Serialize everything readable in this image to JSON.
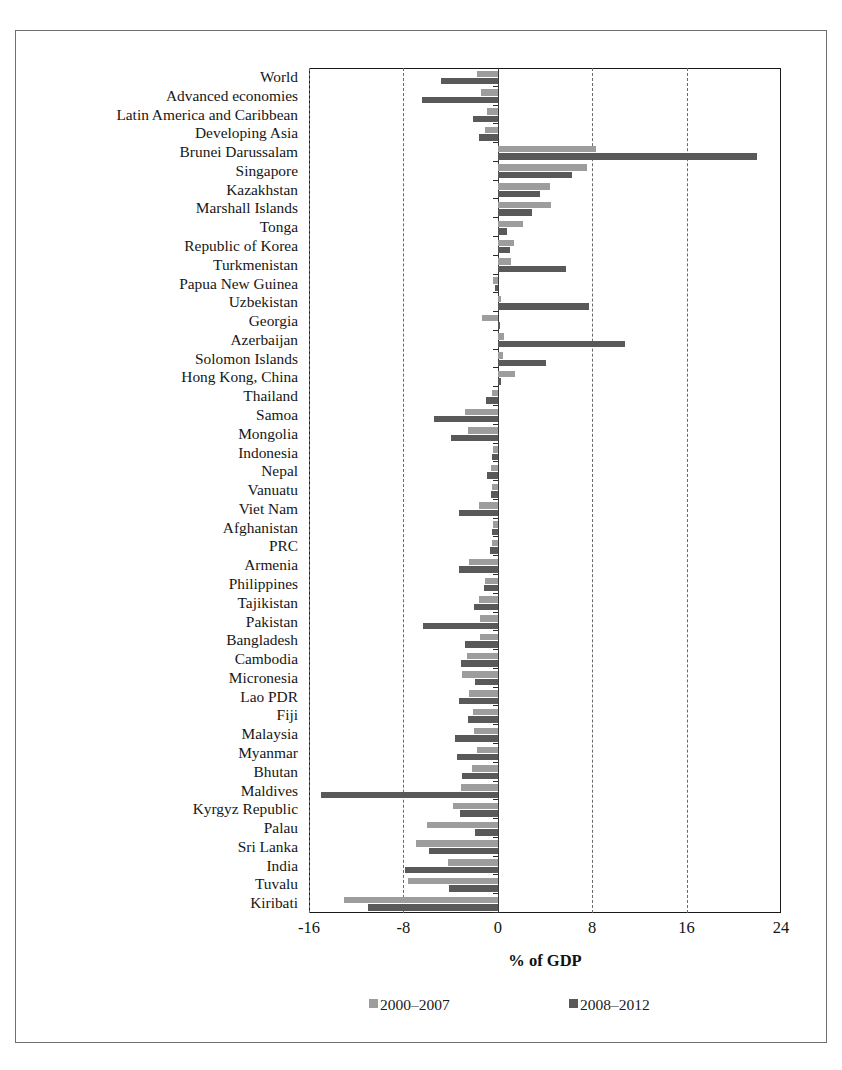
{
  "chart_data": {
    "type": "bar",
    "orientation": "horizontal",
    "title": "",
    "xlabel": "% of GDP",
    "ylabel": "",
    "xlim": [
      -16,
      24
    ],
    "xticks": [
      -16,
      -8,
      0,
      8,
      16,
      24
    ],
    "gridlines": [
      -16,
      -8,
      8,
      16
    ],
    "grid": true,
    "legend_position": "bottom",
    "colors": {
      "2000-2007": "#9d9d9d",
      "2008-2012": "#595959"
    },
    "categories": [
      "World",
      "Advanced economies",
      "Latin America and Caribbean",
      "Developing Asia",
      "Brunei Darussalam",
      "Singapore",
      "Kazakhstan",
      "Marshall Islands",
      "Tonga",
      "Republic of Korea",
      "Turkmenistan",
      "Papua New Guinea",
      "Uzbekistan",
      "Georgia",
      "Azerbaijan",
      "Solomon Islands",
      "Hong Kong, China",
      "Thailand",
      "Samoa",
      "Mongolia",
      "Indonesia",
      "Nepal",
      "Vanuatu",
      "Viet Nam",
      "Afghanistan",
      "PRC",
      "Armenia",
      "Philippines",
      "Tajikistan",
      "Pakistan",
      "Bangladesh",
      "Cambodia",
      "Micronesia",
      "Lao PDR",
      "Fiji",
      "Malaysia",
      "Myanmar",
      "Bhutan",
      "Maldives",
      "Kyrgyz Republic",
      "Palau",
      "Sri Lanka",
      "India",
      "Tuvalu",
      "Kiribati"
    ],
    "series": [
      {
        "name": "2000–2007",
        "color": "#9d9d9d",
        "values": [
          -1.8,
          -1.4,
          -0.9,
          -1.1,
          8.3,
          7.6,
          4.4,
          4.5,
          2.1,
          1.4,
          1.1,
          -0.4,
          0.3,
          -1.3,
          0.5,
          0.4,
          1.5,
          -0.5,
          -2.8,
          -2.5,
          -0.4,
          -0.6,
          -0.5,
          -1.6,
          -0.4,
          -0.5,
          -2.4,
          -1.1,
          -1.6,
          -1.5,
          -1.5,
          -2.6,
          -3.0,
          -2.4,
          -2.1,
          -2.0,
          -1.8,
          -2.2,
          -3.1,
          -3.8,
          -6.0,
          -6.9,
          -4.2,
          -7.6,
          -13.0
        ]
      },
      {
        "name": "2008–2012",
        "color": "#595959",
        "values": [
          -4.8,
          -6.4,
          -2.1,
          -1.6,
          22.0,
          6.3,
          3.6,
          2.9,
          0.8,
          1.0,
          5.8,
          -0.2,
          7.7,
          0.2,
          10.8,
          4.1,
          0.3,
          -1.0,
          -5.4,
          -4.0,
          -0.5,
          -0.9,
          -0.6,
          -3.3,
          -0.5,
          -0.7,
          -3.3,
          -1.2,
          -2.0,
          -6.3,
          -2.8,
          -3.1,
          -1.9,
          -3.3,
          -2.5,
          -3.6,
          -3.5,
          -3.0,
          -15.0,
          -3.2,
          -1.9,
          -5.8,
          -7.9,
          -4.1,
          -11.0
        ]
      }
    ]
  },
  "axis": {
    "tick_labels": [
      "-16",
      "-8",
      "0",
      "8",
      "16",
      "24"
    ],
    "x_title": "% of GDP"
  },
  "legend": {
    "items": [
      {
        "label": "2000–2007",
        "color": "#9d9d9d"
      },
      {
        "label": "2008–2012",
        "color": "#595959"
      }
    ]
  }
}
